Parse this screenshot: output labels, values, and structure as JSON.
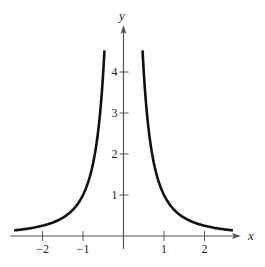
{
  "chart_data": {
    "type": "line",
    "title": "",
    "xlabel": "x",
    "ylabel": "y",
    "xlim": [
      -2.8,
      2.9
    ],
    "ylim": [
      0,
      5.1
    ],
    "x_ticks": [
      -2,
      -1,
      1,
      2
    ],
    "x_tick_labels": [
      "−2",
      "−1",
      "1",
      "2"
    ],
    "y_ticks": [
      1,
      2,
      3,
      4
    ],
    "y_tick_labels": [
      "1",
      "2",
      "3",
      "4"
    ],
    "grid": false,
    "legend": null,
    "series": [
      {
        "name": "y = 1/x^2 (left branch)",
        "x": [
          -2.7,
          -2.4,
          -2.0,
          -1.6,
          -1.3,
          -1.0,
          -0.8,
          -0.65,
          -0.55,
          -0.47
        ],
        "y": [
          0.14,
          0.17,
          0.25,
          0.39,
          0.59,
          1.0,
          1.56,
          2.37,
          3.31,
          4.53
        ]
      },
      {
        "name": "y = 1/x^2 (right branch)",
        "x": [
          0.47,
          0.55,
          0.65,
          0.8,
          1.0,
          1.3,
          1.6,
          2.0,
          2.4,
          2.7
        ],
        "y": [
          4.53,
          3.31,
          2.37,
          1.56,
          1.0,
          0.59,
          0.39,
          0.25,
          0.17,
          0.14
        ]
      }
    ],
    "colors": {
      "curve": "#111111",
      "axis": "#555555"
    }
  }
}
